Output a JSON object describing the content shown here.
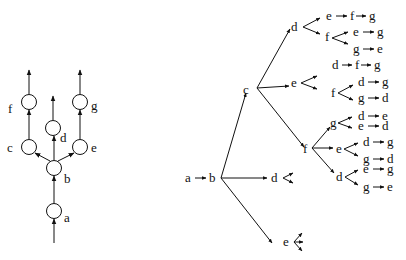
{
  "left_tree": {
    "title": "Partial order graph",
    "nodes": [
      {
        "id": "a",
        "label": "a",
        "cx": 54,
        "cy": 211,
        "lx": 64,
        "ly": 222
      },
      {
        "id": "b",
        "label": "b",
        "cx": 54,
        "cy": 168,
        "lx": 64,
        "ly": 183
      },
      {
        "id": "c",
        "label": "c",
        "cx": 29,
        "cy": 147,
        "lx": 6,
        "ly": 152
      },
      {
        "id": "d",
        "label": "d",
        "cx": 53,
        "cy": 128,
        "lx": 60,
        "ly": 142
      },
      {
        "id": "e",
        "label": "e",
        "cx": 80,
        "cy": 147,
        "lx": 91,
        "ly": 152
      },
      {
        "id": "f",
        "label": "f",
        "cx": 29,
        "cy": 102,
        "lx": 7,
        "ly": 114
      },
      {
        "id": "g",
        "label": "g",
        "cx": 80,
        "cy": 102,
        "lx": 91,
        "ly": 110
      }
    ],
    "edges": [
      {
        "from": "in",
        "to": "a"
      },
      {
        "from": "a",
        "to": "b"
      },
      {
        "from": "b",
        "to": "c"
      },
      {
        "from": "b",
        "to": "d"
      },
      {
        "from": "b",
        "to": "e"
      },
      {
        "from": "c",
        "to": "f"
      },
      {
        "from": "e",
        "to": "g"
      },
      {
        "from": "f",
        "to": "out"
      },
      {
        "from": "d",
        "to": "out"
      },
      {
        "from": "g",
        "to": "out"
      }
    ]
  },
  "right_tree": {
    "title": "Linear extensions tree",
    "root_sequence": [
      "a",
      "b"
    ],
    "labels": [
      {
        "id": "a",
        "text": "a",
        "x": 186,
        "y": 182
      },
      {
        "id": "b",
        "text": "b",
        "x": 210,
        "y": 182
      },
      {
        "id": "c",
        "text": "c",
        "x": 244,
        "y": 94
      },
      {
        "id": "d1",
        "text": "d",
        "x": 292,
        "y": 31
      },
      {
        "id": "e1",
        "text": "e",
        "x": 292,
        "y": 87
      },
      {
        "id": "f1",
        "text": "f",
        "x": 303,
        "y": 153
      },
      {
        "id": "d2",
        "text": "d",
        "x": 272,
        "y": 181
      },
      {
        "id": "e2",
        "text": "e",
        "x": 284,
        "y": 246
      }
    ],
    "sequences": [
      {
        "start": "e",
        "rest": [
          "f",
          "g"
        ],
        "x": 327,
        "y": 20
      },
      {
        "start": "f",
        "branch": true,
        "x": 326,
        "y": 41
      },
      {
        "start": "e",
        "rest": [
          "g"
        ],
        "x": 354,
        "y": 36
      },
      {
        "start": "g",
        "rest": [
          "e"
        ],
        "x": 354,
        "y": 54
      },
      {
        "start": "d",
        "rest": [
          "f",
          "g"
        ],
        "x": 333,
        "y": 69
      },
      {
        "start": "f",
        "branch": true,
        "x": 331,
        "y": 97
      },
      {
        "start": "d",
        "rest": [
          "g"
        ],
        "x": 359,
        "y": 86
      },
      {
        "start": "g",
        "rest": [
          "d"
        ],
        "x": 359,
        "y": 102
      },
      {
        "start": "g",
        "branch": true,
        "x": 331,
        "y": 127
      },
      {
        "start": "d",
        "rest": [
          "e"
        ],
        "x": 359,
        "y": 120
      },
      {
        "start": "e",
        "rest": [
          "d"
        ],
        "x": 359,
        "y": 130
      },
      {
        "start": "e",
        "branch": true,
        "x": 336,
        "y": 153
      },
      {
        "start": "d",
        "rest": [
          "g"
        ],
        "x": 363,
        "y": 146
      },
      {
        "start": "g",
        "rest": [
          "d"
        ],
        "x": 363,
        "y": 163
      },
      {
        "start": "d",
        "branch": true,
        "x": 337,
        "y": 181
      },
      {
        "start": "e",
        "rest": [
          "g"
        ],
        "x": 363,
        "y": 173
      },
      {
        "start": "g",
        "rest": [
          "e"
        ],
        "x": 363,
        "y": 191
      }
    ]
  }
}
